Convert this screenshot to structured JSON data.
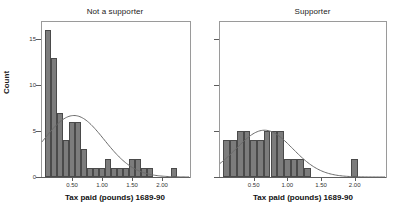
{
  "figure": {
    "axis_y_label": "Count",
    "axis_x_label": "Tax paid (pounds) 1689-90"
  },
  "chart_data": {
    "type": "bar",
    "title": "",
    "xlabel": "Tax paid (pounds) 1689-90",
    "ylabel": "Count",
    "xlim": [
      0.0,
      2.45
    ],
    "ylim": [
      0,
      17
    ],
    "grid": false,
    "legend": "none",
    "panels": [
      {
        "name": "not-a-supporter",
        "title": "Not a supporter",
        "bin_width": 0.1,
        "bin_starts": [
          0.05,
          0.15,
          0.25,
          0.35,
          0.45,
          0.55,
          0.65,
          0.75,
          0.85,
          0.95,
          1.05,
          1.15,
          1.25,
          1.35,
          1.45,
          1.55,
          1.65,
          1.75,
          1.85,
          1.95,
          2.05,
          2.15,
          2.25,
          2.35
        ],
        "values": [
          16,
          13,
          7,
          4,
          6,
          6,
          3,
          1,
          1,
          1,
          2,
          1,
          1,
          1,
          2,
          2,
          1,
          1,
          0,
          0,
          0,
          1,
          0,
          0
        ],
        "normal_curve": {
          "peak_count": 6.7,
          "peak_x": 0.62
        }
      },
      {
        "name": "supporter",
        "title": "Supporter",
        "bin_width": 0.1,
        "bin_starts": [
          0.05,
          0.15,
          0.25,
          0.35,
          0.45,
          0.55,
          0.65,
          0.75,
          0.85,
          0.95,
          1.05,
          1.15,
          1.25,
          1.35,
          1.45,
          1.55,
          1.65,
          1.75,
          1.85,
          1.95,
          2.05,
          2.15
        ],
        "values": [
          4,
          4,
          5,
          5,
          4,
          4,
          5,
          5,
          5,
          2,
          2,
          2,
          1,
          0,
          0,
          0,
          0,
          0,
          0,
          2,
          0,
          0
        ],
        "normal_curve": {
          "peak_count": 5.1,
          "peak_x": 0.78
        }
      }
    ],
    "yticks": [
      {
        "value": 0,
        "label": "0"
      },
      {
        "value": 5,
        "label": "5"
      },
      {
        "value": 10,
        "label": "10"
      },
      {
        "value": 15,
        "label": "15"
      }
    ],
    "xticks": [
      {
        "value": 0.5,
        "label": "0.50"
      },
      {
        "value": 1.0,
        "label": "1.00"
      },
      {
        "value": 1.5,
        "label": "1.50"
      },
      {
        "value": 2.0,
        "label": "2.00"
      }
    ]
  },
  "colors": {
    "bar_fill": "#7c7c7c",
    "bar_edge": "#4a4a4a",
    "curve": "#6b6b6b",
    "axis": "#5c5c5c",
    "text": "#1a1a1a"
  }
}
